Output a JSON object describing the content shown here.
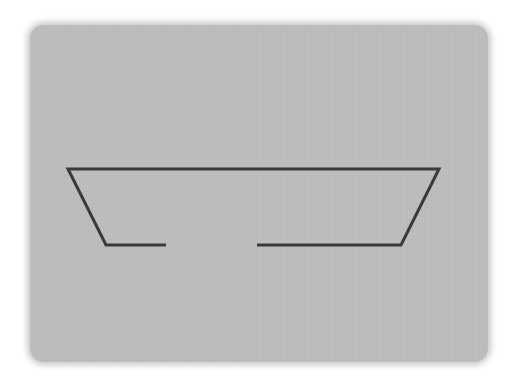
{
  "diagram": {
    "colors": {
      "background": "#ffffff",
      "panel": "#bdbdbd",
      "stroke": "#3a3a3a"
    },
    "panel": {
      "x": 30,
      "y": 25,
      "width": 458,
      "height": 337
    },
    "stroke_width": 3,
    "segments": [
      {
        "name": "left-path",
        "points": "166,245 106,245 68,169 439,169 401,245 257,245"
      }
    ],
    "gap": {
      "x_start": 166,
      "x_end": 257,
      "y": 245
    }
  }
}
